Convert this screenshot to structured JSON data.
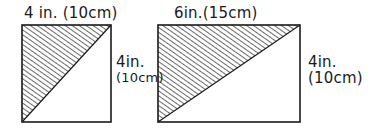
{
  "figures": [
    {
      "id": "square",
      "shape": "square",
      "top_label": "4 in. (10cm)",
      "side_label_line1": "4in.",
      "side_label_line2": "(10cm)",
      "shaded": "upper-left triangle"
    },
    {
      "id": "rectangle",
      "shape": "rectangle",
      "top_label": "6in.(15cm)",
      "side_label_line1": "4in.",
      "side_label_line2": "(10cm)",
      "shaded": "upper-left triangle"
    }
  ],
  "colors": {
    "ink": "#1a1a1a",
    "background": "#ffffff"
  }
}
